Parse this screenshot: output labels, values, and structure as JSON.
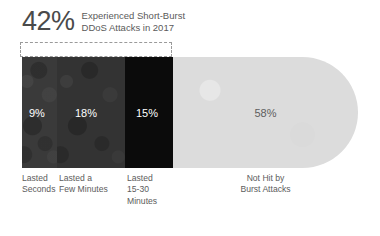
{
  "header": {
    "percent": "42%",
    "line1": "Experienced Short-Burst",
    "line2": "DDoS Attacks in 2017"
  },
  "colors": {
    "segment_1": "#3b3b3b",
    "segment_2": "#333333",
    "segment_3": "#0b0b0b",
    "segment_4": "#dcdcdc",
    "dark_value_text": "#ffffff",
    "light_value_text": "#5e5e5e",
    "label_text": "#5c5c5c",
    "bracket": "#9a9a9a",
    "background": "#ffffff"
  },
  "chart_data": {
    "type": "bar",
    "title": "42% Experienced Short-Burst DDoS Attacks in 2017",
    "subtitle": "",
    "orientation": "horizontal",
    "stacked": true,
    "grid": false,
    "legend": "none",
    "xlabel": "",
    "ylabel": "",
    "unit": "%",
    "total": 100,
    "highlight_group": {
      "label": "42%",
      "value": 42,
      "members": [
        "Lasted Seconds",
        "Lasted a Few Minutes",
        "Lasted 15-30 Minutes"
      ]
    },
    "categories": [
      "Lasted Seconds",
      "Lasted a Few Minutes",
      "Lasted 15-30 Minutes",
      "Not Hit by Burst Attacks"
    ],
    "values": [
      9,
      18,
      15,
      58
    ],
    "value_labels": [
      "9%",
      "18%",
      "15%",
      "58%"
    ]
  },
  "segments": [
    {
      "value_label": "9%",
      "value": 9,
      "caption_line1": "Lasted",
      "caption_line2": "Seconds",
      "caption_line3": ""
    },
    {
      "value_label": "18%",
      "value": 18,
      "caption_line1": "Lasted a",
      "caption_line2": "Few Minutes",
      "caption_line3": ""
    },
    {
      "value_label": "15%",
      "value": 15,
      "caption_line1": "Lasted",
      "caption_line2": "15-30",
      "caption_line3": "Minutes"
    },
    {
      "value_label": "58%",
      "value": 58,
      "caption_line1": "Not Hit by",
      "caption_line2": "Burst Attacks",
      "caption_line3": ""
    }
  ]
}
